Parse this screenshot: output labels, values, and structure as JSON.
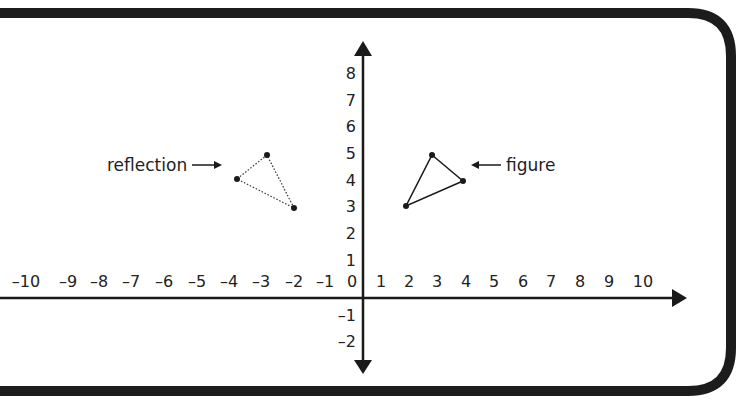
{
  "diagram": {
    "type": "coordinate-plane-reflection",
    "colors": {
      "ink": "#1a1a1a",
      "border": "#1c1c1c",
      "background": "#ffffff"
    },
    "x_axis": {
      "ticks": [
        "–10",
        "–9",
        "–8",
        "–7",
        "–6",
        "–5",
        "–4",
        "–3",
        "–2",
        "–1",
        "0",
        "1",
        "2",
        "3",
        "4",
        "5",
        "6",
        "7",
        "8",
        "9",
        "10"
      ],
      "range": [
        -10,
        10
      ]
    },
    "y_axis": {
      "ticks": [
        "8",
        "7",
        "6",
        "5",
        "4",
        "3",
        "2",
        "1",
        "–1",
        "–2"
      ],
      "range": [
        -2,
        8
      ]
    },
    "labels": {
      "reflection": "reflection",
      "figure": "figure"
    },
    "shapes": {
      "figure": {
        "style": "solid",
        "points": [
          [
            3,
            5
          ],
          [
            4,
            4
          ],
          [
            2,
            3
          ]
        ]
      },
      "reflection": {
        "style": "dotted",
        "points": [
          [
            -3,
            5
          ],
          [
            -4,
            4
          ],
          [
            -2,
            3
          ]
        ]
      }
    }
  }
}
